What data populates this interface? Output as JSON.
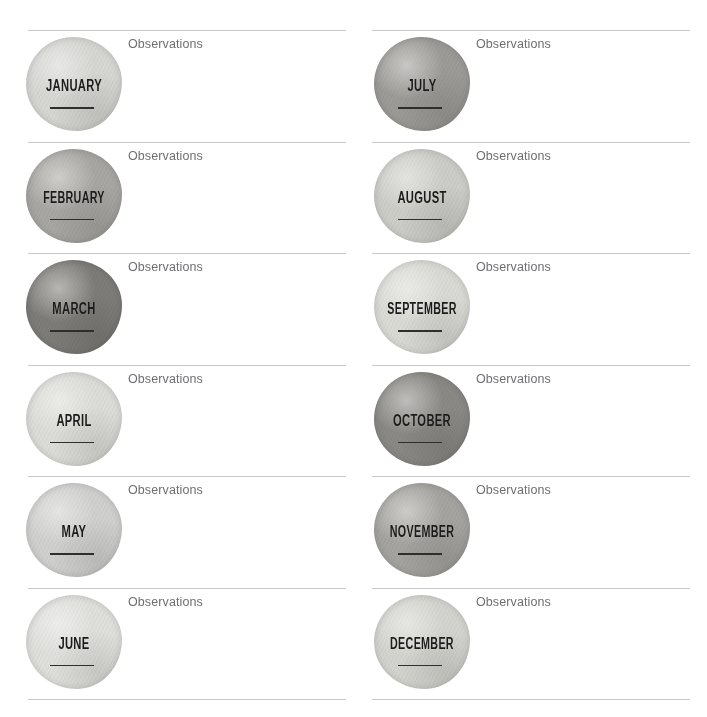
{
  "page": {
    "background_color": "#ffffff",
    "rule_color": "#c9c9cb",
    "label_color": "#6f6f73",
    "month_text_color": "#1b1b1b",
    "write_line_color": "#2e2e2e"
  },
  "observations_label": "Observations",
  "columns": [
    {
      "name": "left-column",
      "rows": [
        {
          "month": "JANUARY",
          "observations_label": "Observations",
          "swatch_color": "#d8d8d5",
          "swatch_tone": "very-light"
        },
        {
          "month": "FEBRUARY",
          "observations_label": "Observations",
          "swatch_color": "#a9a8a4",
          "swatch_tone": "medium"
        },
        {
          "month": "MARCH",
          "observations_label": "Observations",
          "swatch_color": "#7e7d79",
          "swatch_tone": "dark"
        },
        {
          "month": "APRIL",
          "observations_label": "Observations",
          "swatch_color": "#dededa",
          "swatch_tone": "very-light"
        },
        {
          "month": "MAY",
          "observations_label": "Observations",
          "swatch_color": "#d2d2d0",
          "swatch_tone": "light"
        },
        {
          "month": "JUNE",
          "observations_label": "Observations",
          "swatch_color": "#e1e1de",
          "swatch_tone": "very-light"
        }
      ]
    },
    {
      "name": "right-column",
      "rows": [
        {
          "month": "JULY",
          "observations_label": "Observations",
          "swatch_color": "#9d9c98",
          "swatch_tone": "medium-dark"
        },
        {
          "month": "AUGUST",
          "observations_label": "Observations",
          "swatch_color": "#cfcfca",
          "swatch_tone": "light"
        },
        {
          "month": "SEPTEMBER",
          "observations_label": "Observations",
          "swatch_color": "#dcdcd7",
          "swatch_tone": "very-light"
        },
        {
          "month": "OCTOBER",
          "observations_label": "Observations",
          "swatch_color": "#8b8a86",
          "swatch_tone": "dark"
        },
        {
          "month": "NOVEMBER",
          "observations_label": "Observations",
          "swatch_color": "#a6a5a1",
          "swatch_tone": "medium"
        },
        {
          "month": "DECEMBER",
          "observations_label": "Observations",
          "swatch_color": "#d6d6d1",
          "swatch_tone": "light"
        }
      ]
    }
  ]
}
